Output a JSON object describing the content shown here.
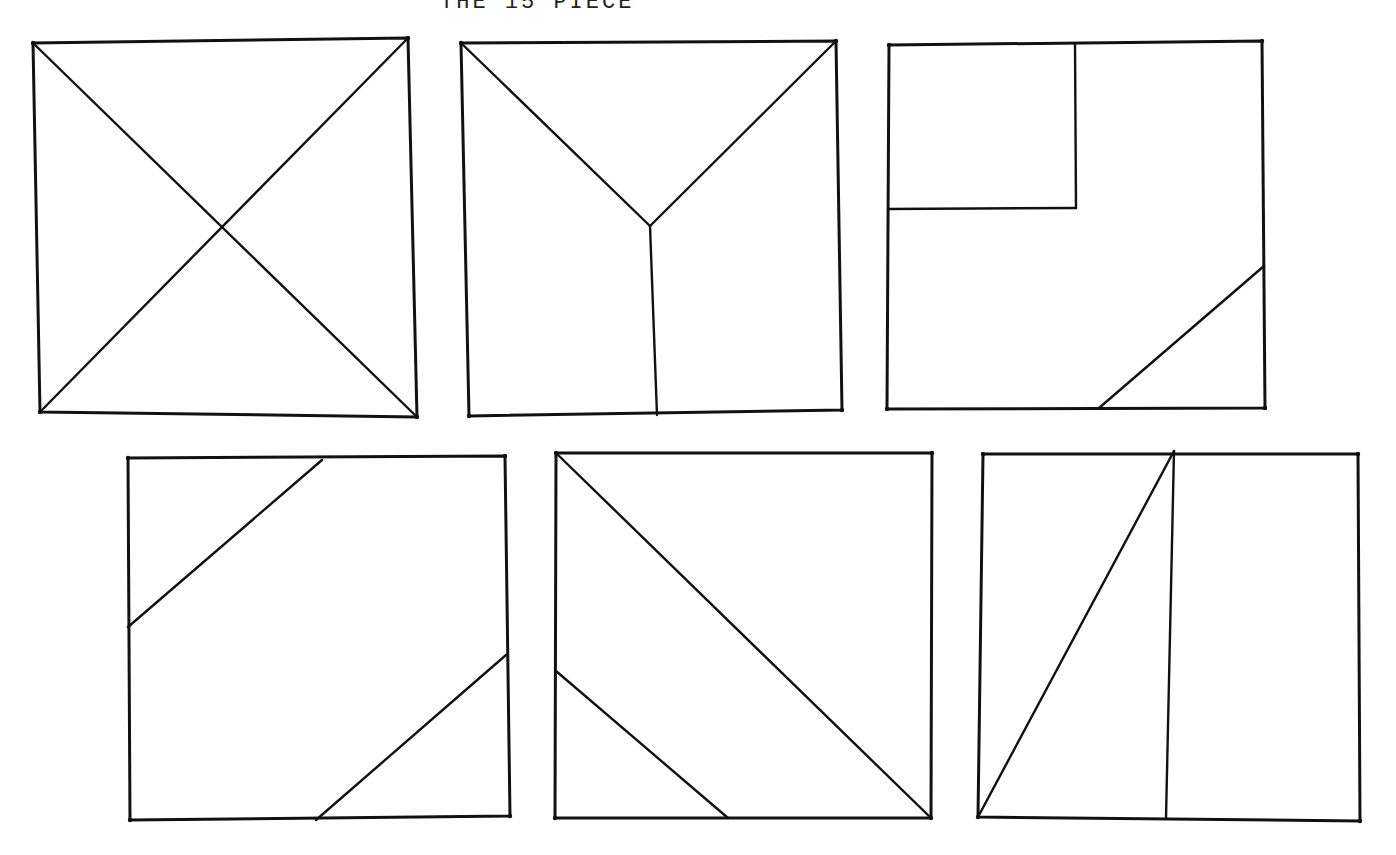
{
  "title": "THE 15 PIECE",
  "colors": {
    "ink": "#111111",
    "paper": "#ffffff"
  },
  "squares": [
    {
      "name": "square-1-x",
      "outline": [
        [
          33,
          43
        ],
        [
          408,
          38
        ],
        [
          417,
          417
        ],
        [
          40,
          412
        ]
      ],
      "lines": [
        [
          [
            33,
            43
          ],
          [
            417,
            417
          ]
        ],
        [
          [
            408,
            38
          ],
          [
            40,
            412
          ]
        ]
      ]
    },
    {
      "name": "square-2-y",
      "outline": [
        [
          461,
          43
        ],
        [
          836,
          41
        ],
        [
          842,
          410
        ],
        [
          469,
          416
        ]
      ],
      "lines": [
        [
          [
            461,
            43
          ],
          [
            650,
            226
          ]
        ],
        [
          [
            836,
            41
          ],
          [
            650,
            226
          ]
        ],
        [
          [
            650,
            226
          ],
          [
            657,
            415
          ]
        ]
      ]
    },
    {
      "name": "square-3-corner-rect",
      "outline": [
        [
          889,
          45
        ],
        [
          1262,
          41
        ],
        [
          1265,
          408
        ],
        [
          887,
          409
        ]
      ],
      "lines": [
        [
          [
            1075,
            44
          ],
          [
            1076,
            208
          ]
        ],
        [
          [
            1076,
            208
          ],
          [
            888,
            209
          ]
        ],
        [
          [
            1264,
            266
          ],
          [
            1099,
            408
          ]
        ]
      ]
    },
    {
      "name": "square-4-two-diagonals",
      "outline": [
        [
          128,
          458
        ],
        [
          505,
          456
        ],
        [
          510,
          816
        ],
        [
          130,
          820
        ]
      ],
      "lines": [
        [
          [
            322,
            460
          ],
          [
            128,
            627
          ]
        ],
        [
          [
            506,
            655
          ],
          [
            316,
            820
          ]
        ]
      ]
    },
    {
      "name": "square-5-diagonal-and-parallel",
      "outline": [
        [
          556,
          453
        ],
        [
          932,
          453
        ],
        [
          931,
          818
        ],
        [
          555,
          818
        ]
      ],
      "lines": [
        [
          [
            556,
            453
          ],
          [
            931,
            818
          ]
        ],
        [
          [
            556,
            671
          ],
          [
            728,
            818
          ]
        ]
      ]
    },
    {
      "name": "square-6-split-triangle",
      "outline": [
        [
          983,
          454
        ],
        [
          1358,
          454
        ],
        [
          1360,
          821
        ],
        [
          978,
          817
        ]
      ],
      "lines": [
        [
          [
            1174,
            451
          ],
          [
            1166,
            818
          ]
        ],
        [
          [
            1174,
            451
          ],
          [
            978,
            817
          ]
        ]
      ]
    }
  ]
}
